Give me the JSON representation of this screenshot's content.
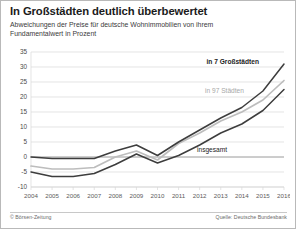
{
  "header": {
    "title": "In Großstädten deutlich überbewertet",
    "subtitle": "Abweichungen der Preise für deutsche Wohnimmobilien von ihrem Fundamentalwert in Prozent"
  },
  "footer": {
    "credit": "© Börsen-Zeitung",
    "source": "Quelle: Deutsche Bundesbank"
  },
  "labels": {
    "series_top": "in 7 Großstädten",
    "series_mid": "in 97 Städten",
    "series_bottom": "insgesamt"
  },
  "colors": {
    "line_dark": "#3d3d3d",
    "line_gray": "#bdbdbd",
    "grid": "#d8d8d8",
    "zero_axis": "#8f8f8f",
    "frame": "#b9b9b9",
    "text": "#1b1b1b",
    "muted_text": "#6a6a6a"
  },
  "chart_data": {
    "type": "line",
    "title": "In Großstädten deutlich überbewertet",
    "subtitle": "Abweichungen der Preise für deutsche Wohnimmobilien von ihrem Fundamentalwert in Prozent",
    "xlabel": "",
    "ylabel": "Prozent",
    "x": [
      2004,
      2005,
      2006,
      2007,
      2008,
      2009,
      2010,
      2011,
      2012,
      2013,
      2014,
      2015,
      2016
    ],
    "xtick_labels": [
      "2004",
      "2005",
      "2006",
      "2007",
      "2008",
      "2009",
      "2010",
      "2011",
      "2012",
      "2013",
      "2014",
      "2015",
      "2016"
    ],
    "ytick_labels": [
      "35",
      "30",
      "25",
      "20",
      "15",
      "10",
      "5",
      "0",
      "-5",
      "-10"
    ],
    "yticks": [
      35,
      30,
      25,
      20,
      15,
      10,
      5,
      0,
      -5,
      -10
    ],
    "ylim": [
      -10,
      35
    ],
    "xlim": [
      2004,
      2016
    ],
    "grid": true,
    "legend_position": "inline-annotations",
    "series": [
      {
        "name": "in 7 Großstädten",
        "color": "#3d3d3d",
        "values": [
          0,
          -0.5,
          -0.5,
          -0.5,
          2,
          4,
          0.5,
          5,
          9,
          13,
          16.5,
          22,
          31
        ]
      },
      {
        "name": "in 97 Städten",
        "color": "#bdbdbd",
        "values": [
          -3,
          -4,
          -4,
          -3.5,
          0,
          2,
          -1,
          4.5,
          8,
          12,
          15,
          19,
          25.5
        ]
      },
      {
        "name": "insgesamt",
        "color": "#3d3d3d",
        "values": [
          -5,
          -6.5,
          -6.5,
          -5.5,
          -2.5,
          1,
          -2,
          0.5,
          4,
          8,
          11,
          15.5,
          22.5
        ]
      }
    ],
    "source": "Quelle: Deutsche Bundesbank",
    "credit": "© Börsen-Zeitung"
  }
}
